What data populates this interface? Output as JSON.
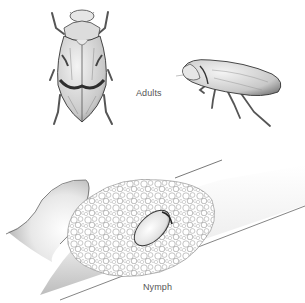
{
  "figure": {
    "labels": {
      "adults": "Adults",
      "nymph": "Nymph"
    },
    "panels": [
      {
        "name": "adult-dorsal-view",
        "caption_ref": "adults"
      },
      {
        "name": "adult-side-view",
        "caption_ref": "adults"
      },
      {
        "name": "nymph-in-spittle-on-stem",
        "caption_ref": "nymph"
      }
    ],
    "colors": {
      "background": "#ffffff",
      "ink": "#333333",
      "shade": "#9a9a9a",
      "label": "#555555"
    }
  }
}
